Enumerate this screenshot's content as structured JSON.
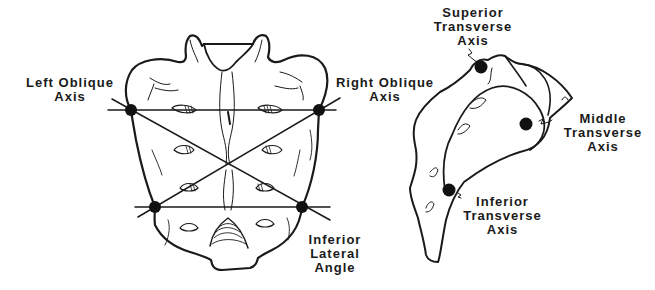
{
  "diagram": {
    "views": [
      {
        "id": "posterior",
        "name": "Sacrum posterior view"
      },
      {
        "id": "lateral",
        "name": "Sacrum lateral view"
      }
    ],
    "labels": {
      "left_oblique": {
        "line1": "Left Oblique",
        "line2": "Axis"
      },
      "right_oblique": {
        "line1": "Right Oblique",
        "line2": "Axis"
      },
      "inferior_lateral_angle": {
        "line1": "Inferior",
        "line2": "Lateral",
        "line3": "Angle"
      },
      "superior_transverse": {
        "line1": "Superior",
        "line2": "Transverse",
        "line3": "Axis"
      },
      "middle_transverse": {
        "line1": "Middle",
        "line2": "Transverse",
        "line3": "Axis"
      },
      "inferior_transverse": {
        "line1": "Inferior",
        "line2": "Transverse",
        "line3": "Axis"
      }
    },
    "colors": {
      "ink": "#1a1a1a",
      "background": "#ffffff"
    }
  }
}
